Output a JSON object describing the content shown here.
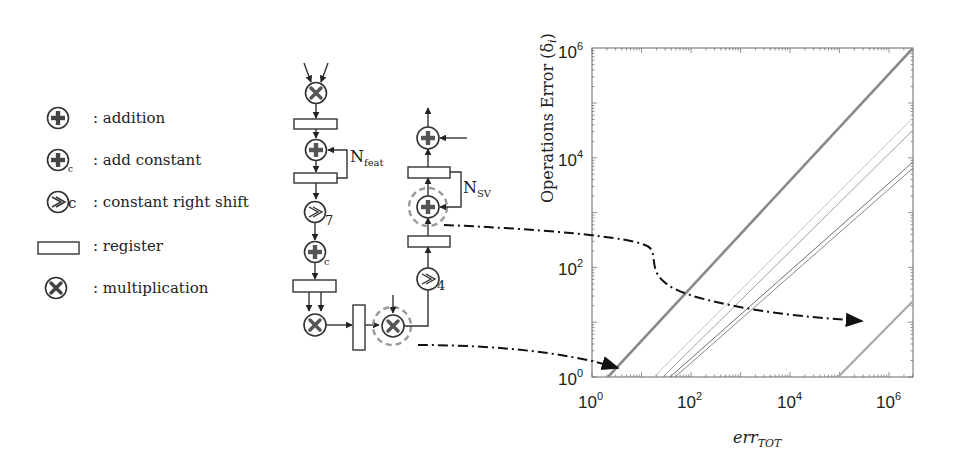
{
  "legend": {
    "items": [
      {
        "symbol": "adder",
        "label": ": addition"
      },
      {
        "symbol": "adder-constant",
        "label": ": add constant",
        "subscript": "c"
      },
      {
        "symbol": "right-shift",
        "label": ": constant right shift",
        "subscript": "c"
      },
      {
        "symbol": "register",
        "label": ": register"
      },
      {
        "symbol": "multiplier",
        "label": ": multiplication"
      }
    ]
  },
  "datapath": {
    "n_feat_label": "N",
    "n_feat_sub": "feat",
    "n_sv_label": "N",
    "n_sv_sub": "SV",
    "shift_left_value": "7",
    "shift_right_value": "4",
    "add_const_sub": "c"
  },
  "chart_data": {
    "type": "line",
    "title": "",
    "xlabel": "err",
    "xlabel_sub": "TOT",
    "ylabel": "Operations Error (δ",
    "ylabel_sub": "i",
    "ylabel_close": ")",
    "xscale": "log",
    "yscale": "log",
    "xlim": [
      1,
      3000000
    ],
    "ylim": [
      1,
      1000000
    ],
    "x_ticks": [
      {
        "base": "10",
        "exp": "0"
      },
      {
        "base": "10",
        "exp": "2"
      },
      {
        "base": "10",
        "exp": "4"
      },
      {
        "base": "10",
        "exp": "6"
      }
    ],
    "y_ticks": [
      {
        "base": "10",
        "exp": "0"
      },
      {
        "base": "10",
        "exp": "2"
      },
      {
        "base": "10",
        "exp": "4"
      },
      {
        "base": "10",
        "exp": "6"
      }
    ],
    "series": [
      {
        "name": "operation-1 (thick)",
        "color": "#8a8a8a",
        "width": 2.6,
        "x": [
          2.1,
          3000000
        ],
        "y": [
          1,
          900000
        ]
      },
      {
        "name": "operation-2",
        "color": "#c8c8c8",
        "width": 1,
        "x": [
          18,
          3000000
        ],
        "y": [
          1,
          25000
        ]
      },
      {
        "name": "operation-3",
        "color": "#9a9a9a",
        "width": 1,
        "x": [
          27,
          3000000
        ],
        "y": [
          1,
          6000
        ]
      },
      {
        "name": "operation-4",
        "color": "#707070",
        "width": 1,
        "x": [
          31,
          3000000
        ],
        "y": [
          1,
          5000
        ]
      },
      {
        "name": "operation-5 (highlighted adder)",
        "color": "#a8a8a8",
        "width": 2.2,
        "x": [
          110000,
          3000000
        ],
        "y": [
          1,
          23
        ]
      }
    ],
    "annotations": [
      {
        "type": "dash-dot-arrow",
        "from": "multiplier (highlighted)",
        "to": "operation-1 line near 10^0"
      },
      {
        "type": "dash-dot-arrow",
        "from": "adder N_SV (highlighted)",
        "to": "operation-5 line"
      }
    ],
    "grid": false,
    "legend_position": "none"
  }
}
